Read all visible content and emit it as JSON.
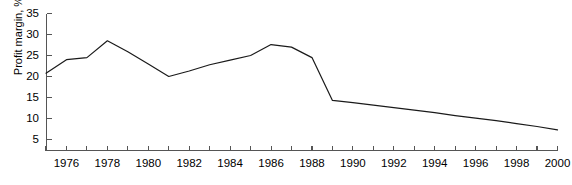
{
  "chart_data": {
    "type": "line",
    "title": "",
    "xlabel": "",
    "ylabel": "Profit margin, %",
    "xlim": [
      1975,
      2000
    ],
    "ylim": [
      0,
      35
    ],
    "y_tick_values": [
      5,
      10,
      15,
      20,
      25,
      30,
      35
    ],
    "y_tick_labels": [
      "5",
      "10",
      "15",
      "20",
      "25",
      "30",
      "35"
    ],
    "x_tick_values": [
      1976,
      1978,
      1980,
      1982,
      1984,
      1986,
      1988,
      1990,
      1992,
      1994,
      1996,
      1998,
      2000
    ],
    "x_tick_labels": [
      "1976",
      "1978",
      "1980",
      "1982",
      "1984",
      "1986",
      "1988",
      "1990",
      "1992",
      "1994",
      "1996",
      "1998",
      "2000"
    ],
    "x_minor_ticks": [
      1975,
      1977,
      1979,
      1981,
      1983,
      1985,
      1987,
      1989,
      1991,
      1993,
      1995,
      1997,
      1999
    ],
    "grid": false,
    "legend": "none",
    "line_color": "#1a1a1a",
    "axis_color": "#555555",
    "series": [
      {
        "name": "Profit margin",
        "x": [
          1975,
          1976,
          1977,
          1978,
          1979,
          1980,
          1981,
          1982,
          1983,
          1984,
          1985,
          1986,
          1987,
          1988,
          1989,
          1990,
          1991,
          1992,
          1993,
          1994,
          1995,
          1996,
          1997,
          1998,
          1999,
          2000
        ],
        "values": [
          20.8,
          24.0,
          24.5,
          28.5,
          25.9,
          23.0,
          20.0,
          21.3,
          22.8,
          23.9,
          25.0,
          27.6,
          27.0,
          24.5,
          14.3,
          13.8,
          13.2,
          12.6,
          12.0,
          11.4,
          10.7,
          10.1,
          9.5,
          8.8,
          8.1,
          7.3
        ]
      }
    ]
  },
  "caption": {
    "ghost_text": ""
  }
}
